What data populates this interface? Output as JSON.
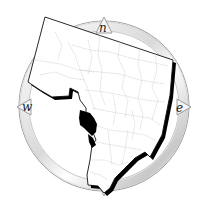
{
  "map": {
    "type": "county-locator-map",
    "description": "Region outline with internal subdivision boundaries over a compass rose; one subdivision highlighted in black",
    "compass": {
      "north_label": "n",
      "east_label": "e",
      "west_label": "w"
    },
    "colors": {
      "background": "#ffffff",
      "outline": "#111111",
      "shadow": "#000000",
      "boundaries": "#bdbdbd",
      "highlight": "#000000",
      "compass_ring": "#9a9a9a"
    }
  }
}
